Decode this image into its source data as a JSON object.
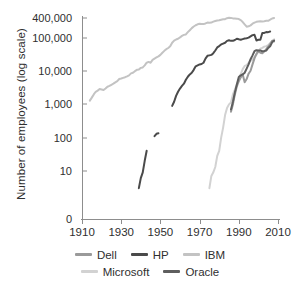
{
  "chart_data": {
    "type": "line",
    "title": "",
    "xlabel": "",
    "ylabel": "Number of employees (log scale)",
    "xlim": [
      1910,
      2010
    ],
    "ylim_log": [
      1,
      400000
    ],
    "grid": false,
    "legend_position": "bottom",
    "x_ticks": [
      "1910",
      "1930",
      "1950",
      "1970",
      "1990",
      "2010"
    ],
    "y_ticks": [
      "400,000",
      "100,000",
      "10,000",
      "1,000",
      "100",
      "10",
      "0"
    ],
    "series": [
      {
        "name": "Dell",
        "color": "#9a9a9a",
        "points": [
          [
            1986,
            600
          ],
          [
            1987,
            1000
          ],
          [
            1988,
            2000
          ],
          [
            1989,
            3500
          ],
          [
            1990,
            5000
          ],
          [
            1991,
            6500
          ],
          [
            1992,
            8000
          ],
          [
            1993,
            4650
          ],
          [
            1994,
            5800
          ],
          [
            1995,
            8400
          ],
          [
            1996,
            10350
          ],
          [
            1997,
            16000
          ],
          [
            1998,
            24400
          ],
          [
            1999,
            33200
          ],
          [
            2000,
            40000
          ],
          [
            2001,
            36000
          ],
          [
            2002,
            34600
          ],
          [
            2003,
            39100
          ],
          [
            2004,
            46000
          ],
          [
            2005,
            55200
          ],
          [
            2006,
            65200
          ],
          [
            2007,
            82700
          ],
          [
            2008,
            78900
          ]
        ]
      },
      {
        "name": "HP",
        "color": "#4a4a4a",
        "segments": [
          [
            [
              1939,
              3
            ],
            [
              1940,
              6
            ],
            [
              1941,
              9
            ],
            [
              1942,
              20
            ],
            [
              1943,
              40
            ]
          ],
          [
            [
              1947,
              110
            ],
            [
              1948,
              130
            ],
            [
              1949,
              135
            ]
          ],
          [
            [
              1956,
              900
            ],
            [
              1957,
              1200
            ],
            [
              1958,
              1800
            ],
            [
              1959,
              2400
            ],
            [
              1960,
              3000
            ],
            [
              1961,
              3600
            ],
            [
              1962,
              4200
            ],
            [
              1963,
              5500
            ],
            [
              1964,
              6800
            ],
            [
              1965,
              8000
            ],
            [
              1966,
              9000
            ],
            [
              1967,
              11000
            ],
            [
              1968,
              14000
            ],
            [
              1969,
              15000
            ],
            [
              1970,
              16000
            ],
            [
              1971,
              16500
            ],
            [
              1972,
              18000
            ],
            [
              1973,
              24000
            ],
            [
              1974,
              29000
            ],
            [
              1975,
              30000
            ],
            [
              1976,
              31000
            ],
            [
              1977,
              35000
            ],
            [
              1978,
              42000
            ],
            [
              1979,
              52000
            ],
            [
              1980,
              57000
            ],
            [
              1981,
              64000
            ],
            [
              1982,
              68000
            ],
            [
              1983,
              72000
            ],
            [
              1984,
              82000
            ],
            [
              1985,
              85000
            ],
            [
              1986,
              82000
            ],
            [
              1987,
              82000
            ],
            [
              1988,
              87000
            ],
            [
              1989,
              95000
            ],
            [
              1990,
              91500
            ],
            [
              1991,
              89000
            ],
            [
              1992,
              92600
            ],
            [
              1993,
              96200
            ],
            [
              1994,
              98400
            ],
            [
              1995,
              102300
            ],
            [
              1996,
              112000
            ],
            [
              1997,
              121900
            ],
            [
              1998,
              124600
            ],
            [
              1999,
              84400
            ],
            [
              2000,
              88500
            ],
            [
              2001,
              88500
            ],
            [
              2002,
              141000
            ],
            [
              2003,
              142000
            ],
            [
              2004,
              151000
            ],
            [
              2005,
              150000
            ],
            [
              2006,
              156000
            ]
          ]
        ]
      },
      {
        "name": "IBM",
        "color": "#c3c3c3",
        "points": [
          [
            1914,
            1300
          ],
          [
            1915,
            1600
          ],
          [
            1916,
            2000
          ],
          [
            1917,
            2400
          ],
          [
            1918,
            2600
          ],
          [
            1919,
            2900
          ],
          [
            1920,
            2800
          ],
          [
            1921,
            2700
          ],
          [
            1922,
            3000
          ],
          [
            1923,
            3400
          ],
          [
            1924,
            3600
          ],
          [
            1925,
            3900
          ],
          [
            1926,
            4200
          ],
          [
            1927,
            4600
          ],
          [
            1928,
            5000
          ],
          [
            1929,
            5800
          ],
          [
            1930,
            6000
          ],
          [
            1931,
            6300
          ],
          [
            1932,
            6600
          ],
          [
            1933,
            7000
          ],
          [
            1934,
            7500
          ],
          [
            1935,
            8600
          ],
          [
            1936,
            9000
          ],
          [
            1937,
            10000
          ],
          [
            1938,
            11000
          ],
          [
            1939,
            11300
          ],
          [
            1940,
            12600
          ],
          [
            1941,
            13000
          ],
          [
            1942,
            15000
          ],
          [
            1943,
            18000
          ],
          [
            1944,
            19000
          ],
          [
            1945,
            18000
          ],
          [
            1946,
            22000
          ],
          [
            1947,
            24000
          ],
          [
            1948,
            26000
          ],
          [
            1949,
            28000
          ],
          [
            1950,
            31000
          ],
          [
            1951,
            36000
          ],
          [
            1952,
            41000
          ],
          [
            1953,
            46000
          ],
          [
            1954,
            50000
          ],
          [
            1955,
            56000
          ],
          [
            1956,
            72000
          ],
          [
            1957,
            83000
          ],
          [
            1958,
            90000
          ],
          [
            1959,
            95000
          ],
          [
            1960,
            104000
          ],
          [
            1961,
            116000
          ],
          [
            1962,
            124000
          ],
          [
            1963,
            128000
          ],
          [
            1964,
            150000
          ],
          [
            1965,
            172000
          ],
          [
            1966,
            198000
          ],
          [
            1967,
            222000
          ],
          [
            1968,
            242000
          ],
          [
            1969,
            258000
          ],
          [
            1970,
            269000
          ],
          [
            1971,
            265000
          ],
          [
            1972,
            262000
          ],
          [
            1973,
            274000
          ],
          [
            1974,
            292000
          ],
          [
            1975,
            288000
          ],
          [
            1976,
            291000
          ],
          [
            1977,
            310000
          ],
          [
            1978,
            325000
          ],
          [
            1979,
            337000
          ],
          [
            1980,
            341000
          ],
          [
            1981,
            355000
          ],
          [
            1982,
            365000
          ],
          [
            1983,
            369000
          ],
          [
            1984,
            395000
          ],
          [
            1985,
            405000
          ],
          [
            1986,
            403000
          ],
          [
            1987,
            389000
          ],
          [
            1988,
            387000
          ],
          [
            1989,
            383000
          ],
          [
            1990,
            373000
          ],
          [
            1991,
            345000
          ],
          [
            1992,
            302000
          ],
          [
            1993,
            256000
          ],
          [
            1994,
            219000
          ],
          [
            1995,
            225000
          ],
          [
            1996,
            240000
          ],
          [
            1997,
            269000
          ],
          [
            1998,
            291000
          ],
          [
            1999,
            307000
          ],
          [
            2000,
            316000
          ],
          [
            2001,
            320000
          ],
          [
            2002,
            316000
          ],
          [
            2003,
            319000
          ],
          [
            2004,
            329000
          ],
          [
            2005,
            329000
          ],
          [
            2006,
            355000
          ],
          [
            2007,
            386000
          ],
          [
            2008,
            398000
          ]
        ]
      },
      {
        "name": "Microsoft",
        "color": "#d2d2d2",
        "points": [
          [
            1975,
            3
          ],
          [
            1976,
            7
          ],
          [
            1977,
            9
          ],
          [
            1978,
            13
          ],
          [
            1979,
            28
          ],
          [
            1980,
            40
          ],
          [
            1981,
            100
          ],
          [
            1982,
            200
          ],
          [
            1983,
            476
          ],
          [
            1984,
            778
          ],
          [
            1985,
            1001
          ],
          [
            1986,
            1153
          ],
          [
            1987,
            2000
          ],
          [
            1988,
            2793
          ],
          [
            1989,
            4037
          ],
          [
            1990,
            5635
          ],
          [
            1991,
            8226
          ],
          [
            1992,
            11542
          ],
          [
            1993,
            14430
          ],
          [
            1994,
            15257
          ],
          [
            1995,
            17801
          ],
          [
            1996,
            20561
          ],
          [
            1997,
            22232
          ],
          [
            1998,
            27320
          ],
          [
            1999,
            31396
          ],
          [
            2000,
            39100
          ],
          [
            2001,
            47600
          ],
          [
            2002,
            50500
          ],
          [
            2003,
            55000
          ],
          [
            2004,
            57000
          ],
          [
            2005,
            61000
          ],
          [
            2006,
            71000
          ],
          [
            2007,
            78600
          ],
          [
            2008,
            91000
          ]
        ]
      },
      {
        "name": "Oracle",
        "color": "#5e5e5e",
        "points": [
          [
            1986,
            700
          ],
          [
            1987,
            1200
          ],
          [
            1988,
            2300
          ],
          [
            1989,
            4000
          ],
          [
            1990,
            6700
          ],
          [
            1991,
            7500
          ],
          [
            1992,
            8000
          ],
          [
            1993,
            9000
          ],
          [
            1994,
            12000
          ],
          [
            1995,
            16000
          ],
          [
            1996,
            23000
          ],
          [
            1997,
            30000
          ],
          [
            1998,
            40000
          ],
          [
            1999,
            43000
          ],
          [
            2000,
            42000
          ],
          [
            2001,
            42000
          ],
          [
            2002,
            40000
          ],
          [
            2003,
            40650
          ],
          [
            2004,
            41650
          ],
          [
            2005,
            50000
          ],
          [
            2006,
            56000
          ],
          [
            2007,
            74000
          ],
          [
            2008,
            84000
          ]
        ]
      }
    ]
  },
  "legend": {
    "rows": [
      [
        {
          "label": "Dell",
          "color": "#9a9a9a"
        },
        {
          "label": "HP",
          "color": "#4a4a4a"
        },
        {
          "label": "IBM",
          "color": "#c3c3c3"
        }
      ],
      [
        {
          "label": "Microsoft",
          "color": "#d2d2d2"
        },
        {
          "label": "Oracle",
          "color": "#5e5e5e"
        }
      ]
    ]
  }
}
